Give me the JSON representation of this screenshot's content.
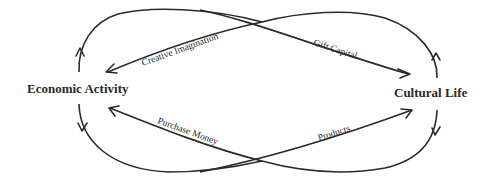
{
  "diagram": {
    "nodes": {
      "left": "Economic Activity",
      "right": "Cultural Life"
    },
    "edges": {
      "creative_imagination": "Creative Imagination",
      "gift_capital": "Gift Capital",
      "purchase_money": "Purchase Money",
      "products": "Products"
    },
    "colors": {
      "ink": "#2b2b2b",
      "background": "#ffffff"
    }
  }
}
